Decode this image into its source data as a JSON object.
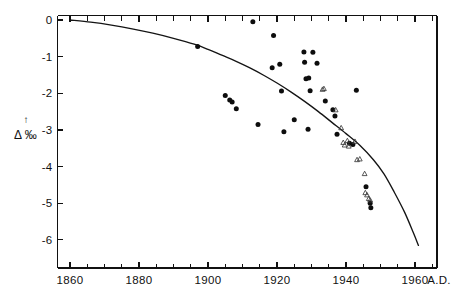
{
  "chart_data": {
    "type": "scatter",
    "title": "",
    "subtitle": "",
    "xlabel": "A.D.",
    "ylabel": "Δ ‰",
    "ylabel_arrow": "↑",
    "xlim": [
      1860,
      1965
    ],
    "ylim": [
      -6.6,
      0.1
    ],
    "grid": false,
    "legend_position": "none",
    "x_ticks": [
      1860,
      1880,
      1900,
      1920,
      1940,
      1960
    ],
    "x_tick_labels": [
      "1860",
      "1880",
      "1900",
      "1920",
      "1940",
      "1960"
    ],
    "x_minor_tick_step": 5,
    "y_ticks": [
      0,
      -1,
      -2,
      -3,
      -4,
      -5,
      -6
    ],
    "y_tick_labels": [
      "0",
      "-1",
      "-2",
      "-3",
      "-4",
      "-5",
      "-6"
    ],
    "series": [
      {
        "name": "filled-circles",
        "marker": "circle-filled",
        "color": "#0d0d0d",
        "points": [
          [
            1897.0,
            -0.72
          ],
          [
            1905.0,
            -2.06
          ],
          [
            1906.3,
            -2.18
          ],
          [
            1907.0,
            -2.24
          ],
          [
            1908.2,
            -2.42
          ],
          [
            1913.0,
            -0.05
          ],
          [
            1914.5,
            -2.85
          ],
          [
            1918.6,
            -1.3
          ],
          [
            1919.0,
            -0.42
          ],
          [
            1920.8,
            -1.21
          ],
          [
            1921.3,
            -1.94
          ],
          [
            1922.0,
            -3.05
          ],
          [
            1925.0,
            -2.72
          ],
          [
            1927.8,
            -0.87
          ],
          [
            1928.0,
            -1.15
          ],
          [
            1928.4,
            -1.6
          ],
          [
            1929.2,
            -1.58
          ],
          [
            1929.6,
            -1.93
          ],
          [
            1929.0,
            -2.98
          ],
          [
            1930.4,
            -0.88
          ],
          [
            1931.6,
            -1.18
          ],
          [
            1934.0,
            -2.21
          ],
          [
            1936.2,
            -2.45
          ],
          [
            1936.8,
            -2.62
          ],
          [
            1937.4,
            -3.12
          ],
          [
            1941.0,
            -3.36
          ],
          [
            1942.0,
            -3.4
          ],
          [
            1943.0,
            -1.92
          ],
          [
            1945.8,
            -4.55
          ],
          [
            1947.0,
            -5.0
          ],
          [
            1947.2,
            -5.12
          ]
        ]
      },
      {
        "name": "open-triangles",
        "marker": "triangle-open",
        "color": "#3a3a3a",
        "points": [
          [
            1933.2,
            -1.9
          ],
          [
            1937.0,
            -2.46
          ],
          [
            1938.6,
            -2.95
          ],
          [
            1939.2,
            -3.35
          ],
          [
            1939.6,
            -3.42
          ],
          [
            1940.4,
            -3.3
          ],
          [
            1940.8,
            -3.45
          ],
          [
            1942.6,
            -3.32
          ],
          [
            1943.2,
            -3.82
          ],
          [
            1945.4,
            -4.2
          ],
          [
            1945.6,
            -4.72
          ],
          [
            1946.1,
            -4.78
          ],
          [
            1946.6,
            -4.88
          ],
          [
            1947.0,
            -4.92
          ],
          [
            1933.6,
            -1.88
          ],
          [
            1944.0,
            -3.8
          ]
        ]
      }
    ],
    "trendline": {
      "name": "model-curve",
      "color": "#141414",
      "points": [
        [
          1860.0,
          0.0
        ],
        [
          1866.0,
          -0.06
        ],
        [
          1872.0,
          -0.14
        ],
        [
          1878.0,
          -0.24
        ],
        [
          1884.0,
          -0.36
        ],
        [
          1890.0,
          -0.5
        ],
        [
          1896.0,
          -0.66
        ],
        [
          1900.0,
          -0.8
        ],
        [
          1904.0,
          -0.96
        ],
        [
          1908.0,
          -1.12
        ],
        [
          1912.0,
          -1.3
        ],
        [
          1916.0,
          -1.5
        ],
        [
          1920.0,
          -1.72
        ],
        [
          1924.0,
          -1.96
        ],
        [
          1928.0,
          -2.22
        ],
        [
          1932.0,
          -2.5
        ],
        [
          1936.0,
          -2.8
        ],
        [
          1940.0,
          -3.1
        ],
        [
          1944.0,
          -3.42
        ],
        [
          1948.0,
          -3.82
        ],
        [
          1951.0,
          -4.2
        ],
        [
          1954.0,
          -4.7
        ],
        [
          1957.0,
          -5.25
        ],
        [
          1959.5,
          -5.8
        ],
        [
          1961.0,
          -6.15
        ]
      ]
    }
  },
  "figure": {
    "x_axis_caption": "A.D.",
    "y_axis_symbol": "Δ",
    "y_axis_unit": "‰",
    "y_axis_arrow": "↑"
  }
}
